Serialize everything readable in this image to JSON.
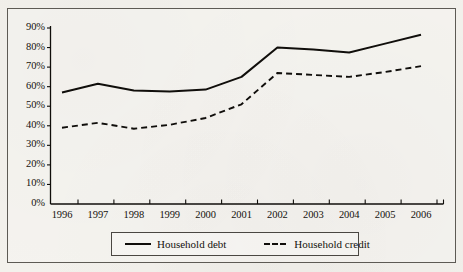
{
  "figure": {
    "background_color": "#f3f1ec",
    "ink_color": "#100e0b",
    "frame_color": "#5d5a54"
  },
  "legend": {
    "debt_label": "Household debt",
    "credit_label": "Household credit",
    "debt_style": "solid",
    "credit_style": "dashed",
    "position": "bottom-center"
  },
  "chart_data": {
    "type": "line",
    "title": "",
    "subtitle": "",
    "xlabel": "",
    "ylabel": "",
    "categories": [
      "1996",
      "1997",
      "1998",
      "1999",
      "2000",
      "2001",
      "2002",
      "2003",
      "2004",
      "2005",
      "2006"
    ],
    "x": [
      1996,
      1997,
      1998,
      1999,
      2000,
      2001,
      2002,
      2003,
      2004,
      2005,
      2006
    ],
    "ylim": [
      0,
      90
    ],
    "ytick_values": [
      0,
      10,
      20,
      30,
      40,
      50,
      60,
      70,
      80,
      90
    ],
    "ytick_labels": [
      "0%",
      "10%",
      "20%",
      "30%",
      "40%",
      "50%",
      "60%",
      "70%",
      "80%",
      "90%"
    ],
    "xtick_labels": [
      "1996",
      "1997",
      "1998",
      "1999",
      "2000",
      "2001",
      "2002",
      "2003",
      "2004",
      "2005",
      "2006"
    ],
    "grid": false,
    "legend_position": "bottom-center",
    "series": [
      {
        "name": "Household debt",
        "style": "solid",
        "color": "#100e0b",
        "values": [
          57.0,
          61.5,
          58.0,
          57.5,
          58.5,
          65.0,
          80.0,
          79.0,
          77.5,
          82.0,
          86.5
        ]
      },
      {
        "name": "Household credit",
        "style": "dashed",
        "color": "#100e0b",
        "values": [
          39.0,
          41.5,
          38.5,
          40.5,
          44.0,
          51.0,
          67.0,
          66.0,
          65.0,
          67.5,
          70.5
        ]
      }
    ]
  }
}
